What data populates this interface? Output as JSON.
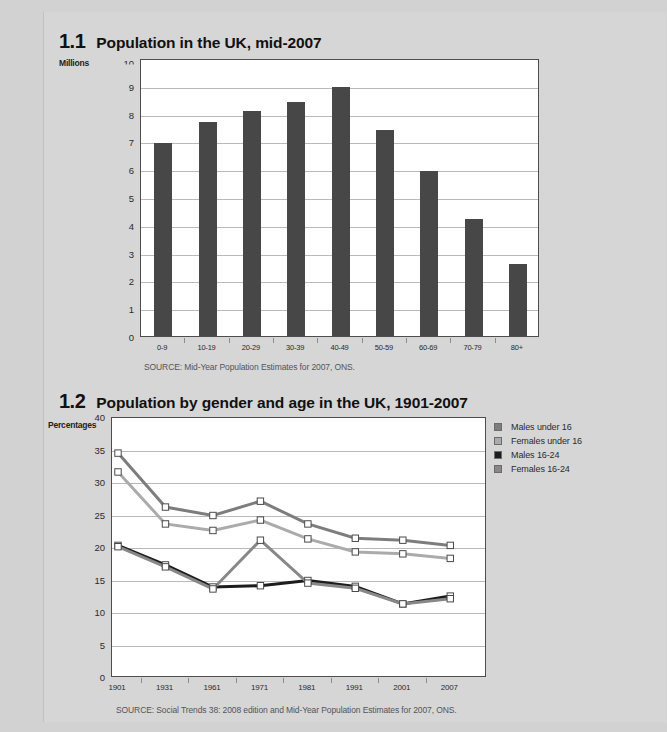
{
  "page": {
    "background_color": "#d2d2d2",
    "sheet_color": "#d6d6d6"
  },
  "figures": [
    {
      "number": "1.1",
      "title": "Population in the UK, mid-2007",
      "axis_unit": "Millions",
      "source": "SOURCE: Mid-Year Population Estimates for 2007, ONS."
    },
    {
      "number": "1.2",
      "title": "Population by gender and age in the UK, 1901-2007",
      "axis_unit": "Percentages",
      "source": "SOURCE: Social Trends 38: 2008 edition and Mid-Year Population Estimates for 2007, ONS."
    }
  ],
  "chart_data": [
    {
      "type": "bar",
      "title": "Population in the UK, mid-2007",
      "xlabel": "",
      "ylabel": "Millions",
      "ylim": [
        0,
        10
      ],
      "yticks": [
        0,
        1,
        2,
        3,
        4,
        5,
        6,
        7,
        8,
        9,
        10
      ],
      "ytick_labels": [
        "0",
        "1",
        "2",
        "3",
        "4",
        "5",
        "6",
        "7",
        "8",
        "9",
        "10"
      ],
      "grid": true,
      "legend": null,
      "bar_color": "#474747",
      "categories": [
        "0-9",
        "10-19",
        "20-29",
        "30-39",
        "40-49",
        "50-59",
        "60-69",
        "70-79",
        "80+"
      ],
      "values": [
        6.95,
        7.7,
        8.1,
        8.4,
        8.95,
        7.4,
        5.95,
        4.2,
        2.6
      ]
    },
    {
      "type": "line",
      "title": "Population by gender and age in the UK, 1901-2007",
      "xlabel": "",
      "ylabel": "Percentages",
      "ylim": [
        0,
        40
      ],
      "yticks": [
        0,
        5,
        10,
        15,
        20,
        25,
        30,
        35,
        40
      ],
      "ytick_labels": [
        "0",
        "5",
        "10",
        "15",
        "20",
        "25",
        "30",
        "35",
        "40"
      ],
      "grid": true,
      "legend_position": "right",
      "x": [
        "1901",
        "1931",
        "1961",
        "1971",
        "1981",
        "1991",
        "2001",
        "2007"
      ],
      "series": [
        {
          "name": "Males under 16",
          "color": "#7d7d7d",
          "values": [
            34.6,
            26.3,
            25.0,
            27.2,
            23.7,
            21.5,
            21.2,
            20.4
          ]
        },
        {
          "name": "Females under 16",
          "color": "#ababab",
          "values": [
            31.7,
            23.7,
            22.7,
            24.3,
            21.4,
            19.4,
            19.1,
            18.4
          ]
        },
        {
          "name": "Males 16-24",
          "color": "#1c1c1c",
          "values": [
            20.4,
            17.4,
            14.0,
            14.2,
            15.0,
            14.1,
            11.4,
            12.6
          ]
        },
        {
          "name": "Females 16-24",
          "color": "#888888",
          "values": [
            20.2,
            17.1,
            13.7,
            21.2,
            14.6,
            13.8,
            11.4,
            12.2
          ]
        }
      ]
    }
  ]
}
